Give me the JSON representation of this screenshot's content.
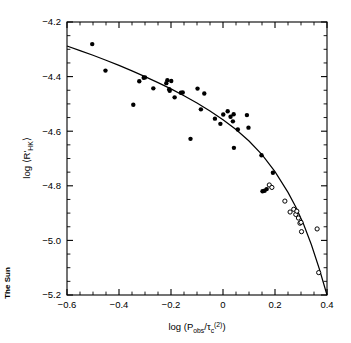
{
  "figure": {
    "corner_note": "The Sun",
    "background_color": "#ffffff",
    "ink_color": "#000000"
  },
  "axes": {
    "x_title_parts": {
      "lead": "log (P",
      "sub1": "obs",
      "mid": "/τ",
      "sub2": "c",
      "sup": "(2)",
      "tail": ")"
    },
    "y_title_parts": {
      "lead": "log ⟨R'",
      "sub": "HK",
      "tail": "⟩"
    },
    "x_tick_labels": [
      "-0.6",
      "-0.4",
      "-0.2",
      "0",
      "0.2",
      "0.4"
    ],
    "y_tick_labels": [
      "-4.2",
      "-4.4",
      "-4.6",
      "-4.8",
      "-5.0",
      "-5.2"
    ]
  },
  "chart_data": {
    "type": "scatter",
    "title": "",
    "xlabel": "log (P_obs/τ_c^(2))",
    "ylabel": "log ⟨R'_HK⟩",
    "xlim": [
      -0.6,
      0.4
    ],
    "ylim": [
      -5.2,
      -4.2
    ],
    "x_ticks": [
      -0.6,
      -0.4,
      -0.2,
      0,
      0.2,
      0.4
    ],
    "y_ticks": [
      -5.2,
      -5.0,
      -4.8,
      -4.6,
      -4.4,
      -4.2
    ],
    "x_minor_step": 0.05,
    "y_minor_step": 0.05,
    "grid": false,
    "legend": null,
    "series": [
      {
        "name": "filled-circles",
        "marker": "filled-circle",
        "marker_size_px": 4.4,
        "points": [
          [
            -0.503,
            -4.281
          ],
          [
            -0.452,
            -4.378
          ],
          [
            -0.345,
            -4.503
          ],
          [
            -0.322,
            -4.417
          ],
          [
            -0.305,
            -4.404
          ],
          [
            -0.3,
            -4.403
          ],
          [
            -0.268,
            -4.443
          ],
          [
            -0.218,
            -4.424
          ],
          [
            -0.214,
            -4.413
          ],
          [
            -0.207,
            -4.446
          ],
          [
            -0.205,
            -4.452
          ],
          [
            -0.199,
            -4.416
          ],
          [
            -0.186,
            -4.476
          ],
          [
            -0.162,
            -4.459
          ],
          [
            -0.155,
            -4.458
          ],
          [
            -0.125,
            -4.628
          ],
          [
            -0.098,
            -4.444
          ],
          [
            -0.085,
            -4.52
          ],
          [
            -0.072,
            -4.462
          ],
          [
            -0.031,
            -4.554
          ],
          [
            -0.01,
            -4.573
          ],
          [
            0.001,
            -4.539
          ],
          [
            0.018,
            -4.527
          ],
          [
            0.029,
            -4.547
          ],
          [
            0.038,
            -4.564
          ],
          [
            0.041,
            -4.538
          ],
          [
            0.042,
            -4.661
          ],
          [
            0.057,
            -4.594
          ],
          [
            0.092,
            -4.541
          ],
          [
            0.098,
            -4.587
          ],
          [
            0.148,
            -4.688
          ],
          [
            0.152,
            -4.82
          ],
          [
            0.16,
            -4.818
          ],
          [
            0.168,
            -4.812
          ],
          [
            0.192,
            -4.752
          ]
        ]
      },
      {
        "name": "open-circles",
        "marker": "open-circle",
        "marker_size_px": 4.2,
        "points": [
          [
            0.178,
            -4.797
          ],
          [
            0.188,
            -4.806
          ],
          [
            0.238,
            -4.856
          ],
          [
            0.258,
            -4.896
          ],
          [
            0.272,
            -4.886
          ],
          [
            0.28,
            -4.905
          ],
          [
            0.284,
            -4.893
          ],
          [
            0.29,
            -4.918
          ],
          [
            0.296,
            -4.937
          ],
          [
            0.3,
            -4.934
          ],
          [
            0.302,
            -4.968
          ],
          [
            0.362,
            -4.958
          ],
          [
            0.368,
            -5.118
          ]
        ]
      }
    ],
    "fit_curve": {
      "name": "fitted-relation",
      "style": "solid",
      "points": [
        [
          -0.6,
          -4.288
        ],
        [
          -0.55,
          -4.305
        ],
        [
          -0.5,
          -4.322
        ],
        [
          -0.45,
          -4.34
        ],
        [
          -0.4,
          -4.359
        ],
        [
          -0.35,
          -4.379
        ],
        [
          -0.3,
          -4.4
        ],
        [
          -0.25,
          -4.422
        ],
        [
          -0.2,
          -4.445
        ],
        [
          -0.15,
          -4.47
        ],
        [
          -0.1,
          -4.497
        ],
        [
          -0.05,
          -4.526
        ],
        [
          0.0,
          -4.558
        ],
        [
          0.05,
          -4.594
        ],
        [
          0.1,
          -4.636
        ],
        [
          0.15,
          -4.686
        ],
        [
          0.2,
          -4.748
        ],
        [
          0.25,
          -4.824
        ],
        [
          0.28,
          -4.878
        ],
        [
          0.31,
          -4.941
        ],
        [
          0.34,
          -5.016
        ],
        [
          0.37,
          -5.103
        ],
        [
          0.4,
          -5.2
        ]
      ]
    }
  }
}
